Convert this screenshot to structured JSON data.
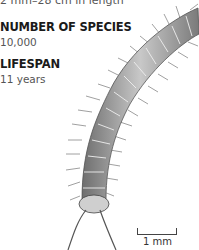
{
  "length_text": "2 mm–28 cm in length",
  "facts": [
    {
      "label": "NUMBER OF SPECIES",
      "value": "10,000"
    },
    {
      "label": "LIFESPAN",
      "value": "11 years"
    }
  ],
  "illustration": {
    "subject": "millipede",
    "shading": "#8a8a8a"
  },
  "scale_bar": {
    "label": "1 mm"
  }
}
